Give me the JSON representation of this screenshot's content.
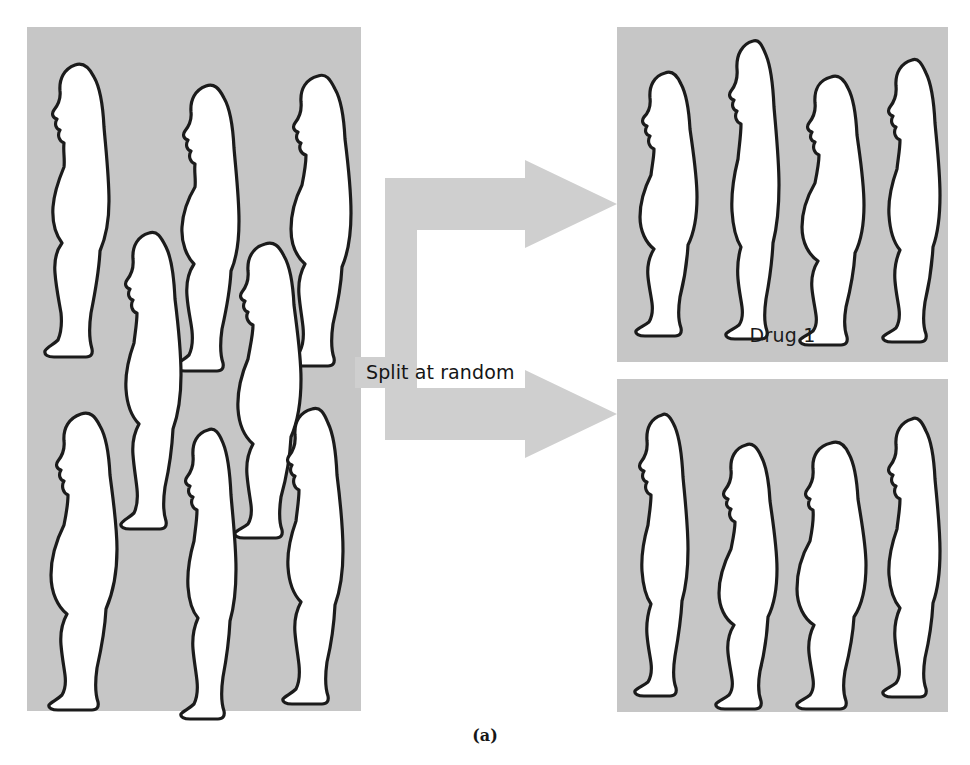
{
  "caption": "(a)",
  "colors": {
    "panel_gray": "#c6c6c6",
    "arrow_gray": "#cfcfcf",
    "figure_fill": "#ffffff",
    "figure_outline": "#1b1b1b",
    "text": "#151515",
    "page_background": "#ffffff"
  },
  "split_arrow": {
    "label": "Split at random",
    "icon": "split-arrow-icon",
    "branches": 2,
    "direction": "right"
  },
  "pool": {
    "name": "subject-pool",
    "subject_count": 8,
    "subjects": [
      {
        "id": "pool-1",
        "body_type": "overweight",
        "row": "top",
        "icon": "person-silhouette-icon"
      },
      {
        "id": "pool-2",
        "body_type": "overweight",
        "row": "top",
        "icon": "person-silhouette-icon"
      },
      {
        "id": "pool-3",
        "body_type": "overweight",
        "row": "top",
        "icon": "person-silhouette-icon"
      },
      {
        "id": "pool-4",
        "body_type": "average",
        "row": "middle",
        "icon": "person-silhouette-icon"
      },
      {
        "id": "pool-5",
        "body_type": "heavy",
        "row": "middle",
        "icon": "person-silhouette-icon"
      },
      {
        "id": "pool-6",
        "body_type": "overweight",
        "row": "bottom",
        "icon": "person-silhouette-icon"
      },
      {
        "id": "pool-7",
        "body_type": "slim",
        "row": "bottom",
        "icon": "person-silhouette-icon"
      },
      {
        "id": "pool-8",
        "body_type": "average",
        "row": "bottom",
        "icon": "person-silhouette-icon"
      }
    ]
  },
  "groups": [
    {
      "key": "drug1",
      "label": "Drug 1",
      "subject_count": 4,
      "subjects": [
        {
          "id": "d1-1",
          "body_type": "overweight",
          "icon": "person-silhouette-icon"
        },
        {
          "id": "d1-2",
          "body_type": "tall-slim",
          "icon": "person-silhouette-icon"
        },
        {
          "id": "d1-3",
          "body_type": "heavy",
          "icon": "person-silhouette-icon"
        },
        {
          "id": "d1-4",
          "body_type": "average",
          "icon": "person-silhouette-icon"
        }
      ]
    },
    {
      "key": "drug2",
      "label": "Drug 2",
      "subject_count": 4,
      "subjects": [
        {
          "id": "d2-1",
          "body_type": "slim",
          "icon": "person-silhouette-icon"
        },
        {
          "id": "d2-2",
          "body_type": "heavy",
          "icon": "person-silhouette-icon"
        },
        {
          "id": "d2-3",
          "body_type": "overweight",
          "icon": "person-silhouette-icon"
        },
        {
          "id": "d2-4",
          "body_type": "average",
          "icon": "person-silhouette-icon"
        }
      ]
    }
  ]
}
